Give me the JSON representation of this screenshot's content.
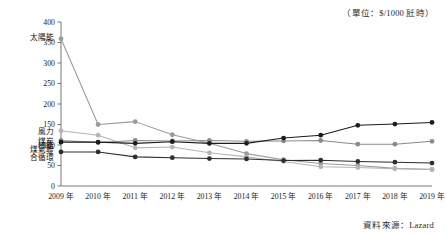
{
  "annotations": {
    "unit_note": "（單位：$/1000 瓩時）",
    "source_note": "資料來源：Lazard"
  },
  "chart_data": {
    "type": "line",
    "title": "",
    "xlabel": "",
    "ylabel": "",
    "ylim": [
      0,
      400
    ],
    "ytick_step": 50,
    "grid": false,
    "legend_position": "inline-left",
    "categories": [
      "2009 年",
      "2010 年",
      "2011 年",
      "2012 年",
      "2013 年",
      "2014 年",
      "2015 年",
      "2016 年",
      "2017 年",
      "2018 年",
      "2019 年"
    ],
    "yticks": [
      "0",
      "50",
      "100",
      "150",
      "200",
      "250",
      "300",
      "350",
      "400"
    ],
    "series": [
      {
        "name": "太陽能",
        "color": "#9a9a9a",
        "marker": "circle",
        "values": [
          359,
          150,
          157,
          125,
          104,
          79,
          64,
          55,
          50,
          43,
          40
        ]
      },
      {
        "name": "風力",
        "color": "#b5b5b5",
        "marker": "circle",
        "values": [
          135,
          124,
          93,
          95,
          81,
          71,
          60,
          47,
          45,
          42,
          41
        ]
      },
      {
        "name": "煤炭",
        "color": "#8a8a8a",
        "marker": "circle",
        "values": [
          111,
          106,
          111,
          110,
          111,
          109,
          110,
          111,
          102,
          102,
          109
        ]
      },
      {
        "name": "核能",
        "color": "#1c1c1c",
        "marker": "circle",
        "values": [
          107,
          107,
          104,
          108,
          104,
          104,
          117,
          124,
          148,
          151,
          155
        ]
      },
      {
        "name": "煤氣聯合循環",
        "color": "#2e2e2e",
        "marker": "circle",
        "values": [
          83,
          83,
          71,
          69,
          67,
          66,
          62,
          63,
          60,
          58,
          56
        ]
      }
    ]
  }
}
